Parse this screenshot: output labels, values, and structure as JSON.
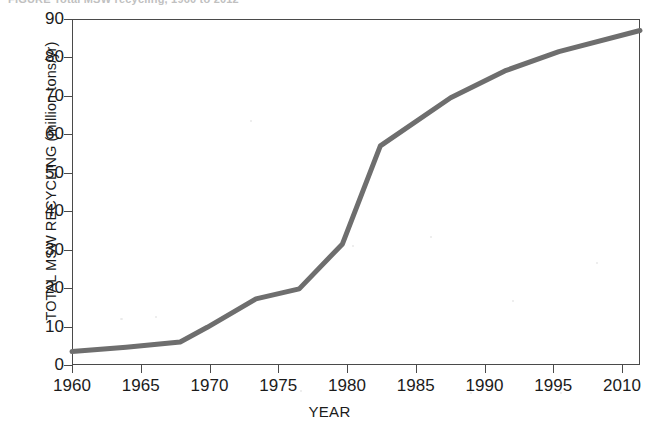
{
  "figure": {
    "top_caption_sliver": "FIGURE  Total MSW recycling, 1960 to 2012"
  },
  "chart_data": {
    "type": "line",
    "title": "",
    "xlabel": "YEAR",
    "ylabel": "TOTAL MSW RECYCLING (million tons/yr)",
    "xlim": [
      1960,
      2012.5
    ],
    "ylim": [
      0,
      90
    ],
    "grid": false,
    "legend": null,
    "line_color": "#6e6e6e",
    "line_width": 5,
    "xticks": [
      1960,
      1965,
      1970,
      1975,
      1980,
      1985,
      1990,
      1995,
      2010
    ],
    "xtick_labels": [
      "1960",
      "1965",
      "1970",
      "1975",
      "1980",
      "1985",
      "1990",
      "1995",
      "2010"
    ],
    "yticks": [
      0,
      10,
      20,
      30,
      40,
      50,
      60,
      70,
      80,
      90
    ],
    "ytick_labels": [
      "0",
      "10",
      "20",
      "30",
      "40",
      "50",
      "60",
      "70",
      "80",
      "90"
    ],
    "series": [
      {
        "name": "Total MSW recycling",
        "x": [
          1960,
          1965,
          1970,
          1972.5,
          1977,
          1981,
          1985,
          1988.5,
          1995,
          2000,
          2005,
          2012.5
        ],
        "y": [
          3.5,
          4.6,
          6.0,
          9.8,
          17.2,
          19.8,
          31.5,
          57.0,
          69.5,
          76.5,
          81.5,
          87.0
        ]
      }
    ]
  }
}
